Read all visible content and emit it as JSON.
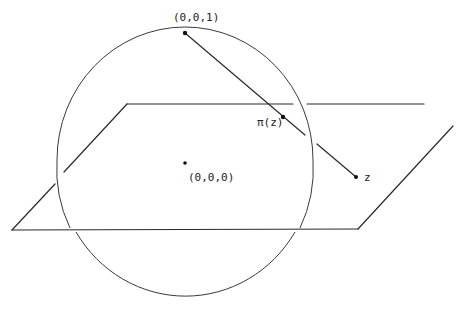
{
  "diagram": {
    "labels": {
      "north_pole": "(0,0,1)",
      "origin": "(0,0,0)",
      "projection": "π(z)",
      "point": "z"
    },
    "colors": {
      "ink": "#2a2a2a",
      "background": "#ffffff"
    },
    "sphere": {
      "cx": 185,
      "cy": 165,
      "r": 133
    },
    "points": {
      "north_pole": [
        185,
        33
      ],
      "origin": [
        185,
        163
      ],
      "projection": [
        283,
        117
      ],
      "point": [
        356,
        177
      ]
    }
  }
}
